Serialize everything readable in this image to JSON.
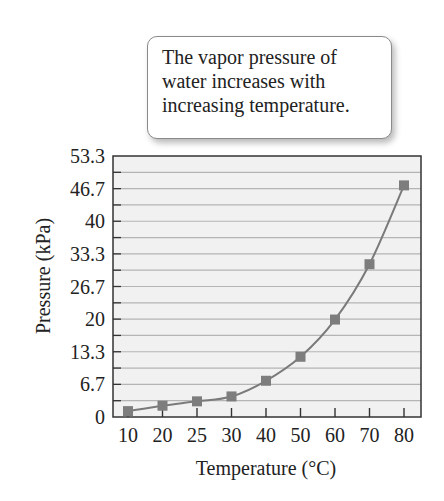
{
  "callout": {
    "lines": [
      "The vapor pressure of",
      "water increases with",
      "increasing temperature."
    ]
  },
  "colors": {
    "plot_bg": "#f1f1f1",
    "gridline": "#b4b4b4",
    "axis": "#333333",
    "series": "#7a7a7a",
    "marker": "#7d7d7d"
  },
  "chart_data": {
    "type": "line",
    "title": "",
    "annotation": "The vapor pressure of water increases with increasing temperature.",
    "xlabel": "Temperature (°C)",
    "ylabel": "Pressure (kPa)",
    "categories": [
      "10",
      "20",
      "25",
      "30",
      "40",
      "50",
      "60",
      "70",
      "80"
    ],
    "series": [
      {
        "name": "Vapor pressure of water",
        "values": [
          1.2,
          2.3,
          3.2,
          4.2,
          7.4,
          12.3,
          19.9,
          31.2,
          47.3
        ]
      }
    ],
    "yticks": [
      "0",
      "6.7",
      "13.3",
      "20",
      "26.7",
      "33.3",
      "40",
      "46.7",
      "53.3"
    ],
    "ylim": [
      0,
      53.3
    ],
    "grid": true,
    "legend": "none",
    "marker": "square"
  }
}
